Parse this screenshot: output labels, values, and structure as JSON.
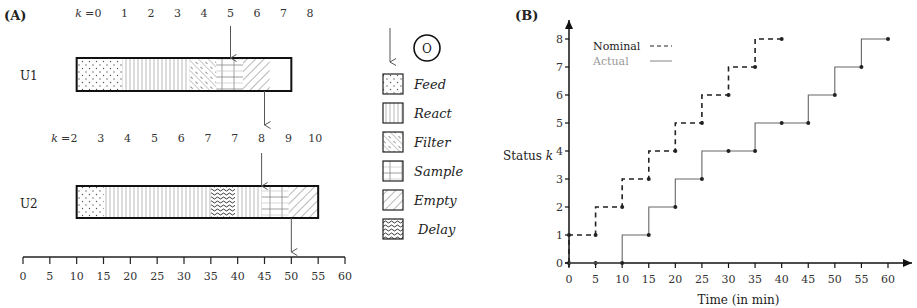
{
  "panel_a": {
    "label": "(A)",
    "units": [
      {
        "name": "U1",
        "k_prefix": "k =",
        "k_labels": [
          "0",
          "1",
          "2",
          "3",
          "4",
          "5",
          "6",
          "7",
          "8"
        ],
        "segments": [
          {
            "phase": "Feed",
            "start": 10,
            "end": 18.5
          },
          {
            "phase": "React",
            "start": 18.5,
            "end": 31
          },
          {
            "phase": "Filter",
            "start": 31,
            "end": 36
          },
          {
            "phase": "Sample",
            "start": 36,
            "end": 41
          },
          {
            "phase": "Empty",
            "start": 41,
            "end": 46
          },
          {
            "phase": "Idle",
            "start": 46,
            "end": 50
          }
        ],
        "arrow_in_k": "5",
        "arrow_out_time": 45
      },
      {
        "name": "U2",
        "k_prefix": "k =",
        "k_labels": [
          "2",
          "3",
          "4",
          "5",
          "6",
          "7",
          "7",
          "8",
          "9",
          "10"
        ],
        "segments": [
          {
            "phase": "Feed",
            "start": 10,
            "end": 15
          },
          {
            "phase": "React",
            "start": 15,
            "end": 35
          },
          {
            "phase": "Delay",
            "start": 35,
            "end": 39.5
          },
          {
            "phase": "React",
            "start": 39.5,
            "end": 44.5
          },
          {
            "phase": "Sample",
            "start": 44.5,
            "end": 49.5
          },
          {
            "phase": "Empty",
            "start": 49.5,
            "end": 55
          }
        ],
        "arrow_in_k": "8",
        "arrow_out_time": 50
      }
    ],
    "time_axis": {
      "ticks": [
        "0",
        "5",
        "10",
        "15",
        "20",
        "25",
        "30",
        "35",
        "40",
        "45",
        "50",
        "55",
        "60"
      ]
    },
    "legend": {
      "arrow_symbol": "O",
      "items": [
        {
          "key": "Feed",
          "label": "Feed",
          "italic": true
        },
        {
          "key": "React",
          "label": "React",
          "italic": true
        },
        {
          "key": "Filter",
          "label": "Filter",
          "italic": true
        },
        {
          "key": "Sample",
          "label": "Sample",
          "italic": true
        },
        {
          "key": "Empty",
          "label": "Empty",
          "italic": true
        },
        {
          "key": "Delay",
          "label": "Delay",
          "italic": false
        }
      ]
    }
  },
  "chart_data": {
    "type": "line",
    "panel_label": "(B)",
    "title": "",
    "xlabel": "Time (in min)",
    "ylabel": "Status k",
    "xlim": [
      0,
      60
    ],
    "ylim": [
      0,
      8
    ],
    "x_ticks": [
      0,
      5,
      10,
      15,
      20,
      25,
      30,
      35,
      40,
      45,
      50,
      55,
      60
    ],
    "y_ticks": [
      0,
      1,
      2,
      3,
      4,
      5,
      6,
      7,
      8
    ],
    "grid": false,
    "legend_position": "top-left",
    "series": [
      {
        "name": "Nominal",
        "style": "dashed",
        "color": "#222222",
        "step": "post",
        "points": [
          [
            0,
            0
          ],
          [
            0,
            1
          ],
          [
            5,
            1
          ],
          [
            5,
            2
          ],
          [
            10,
            2
          ],
          [
            10,
            3
          ],
          [
            15,
            3
          ],
          [
            15,
            4
          ],
          [
            20,
            4
          ],
          [
            20,
            5
          ],
          [
            25,
            5
          ],
          [
            25,
            6
          ],
          [
            30,
            6
          ],
          [
            30,
            7
          ],
          [
            35,
            7
          ],
          [
            35,
            8
          ],
          [
            40,
            8
          ]
        ],
        "markers": [
          [
            0,
            0
          ],
          [
            5,
            0
          ],
          [
            0,
            1
          ],
          [
            5,
            1
          ],
          [
            10,
            2
          ],
          [
            15,
            3
          ],
          [
            20,
            4
          ],
          [
            25,
            5
          ],
          [
            30,
            6
          ],
          [
            35,
            7
          ],
          [
            40,
            8
          ]
        ]
      },
      {
        "name": "Actual",
        "style": "solid",
        "color": "#666666",
        "step": "post",
        "points": [
          [
            0,
            0
          ],
          [
            10,
            0
          ],
          [
            10,
            1
          ],
          [
            15,
            1
          ],
          [
            15,
            2
          ],
          [
            20,
            2
          ],
          [
            20,
            3
          ],
          [
            25,
            3
          ],
          [
            25,
            4
          ],
          [
            35,
            4
          ],
          [
            35,
            5
          ],
          [
            45,
            5
          ],
          [
            45,
            6
          ],
          [
            50,
            6
          ],
          [
            50,
            7
          ],
          [
            55,
            7
          ],
          [
            55,
            8
          ],
          [
            60,
            8
          ]
        ],
        "markers": [
          [
            10,
            0
          ],
          [
            15,
            1
          ],
          [
            20,
            2
          ],
          [
            25,
            3
          ],
          [
            30,
            4
          ],
          [
            35,
            4
          ],
          [
            40,
            5
          ],
          [
            45,
            5
          ],
          [
            50,
            6
          ],
          [
            55,
            7
          ],
          [
            60,
            8
          ]
        ]
      }
    ]
  }
}
